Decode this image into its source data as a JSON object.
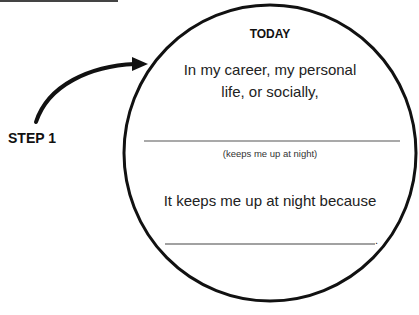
{
  "diagram": {
    "step_label": "STEP 1",
    "circle": {
      "title": "TODAY",
      "prompt_line1": "In my career, my personal",
      "prompt_line2": "life, or socially,",
      "blank1_hint": "(keeps me up at night)",
      "prompt2": "It keeps me up at night because",
      "blank2_terminator": "."
    },
    "colors": {
      "stroke": "#111111",
      "text": "#222222",
      "rule": "#555555",
      "background": "#ffffff"
    }
  }
}
